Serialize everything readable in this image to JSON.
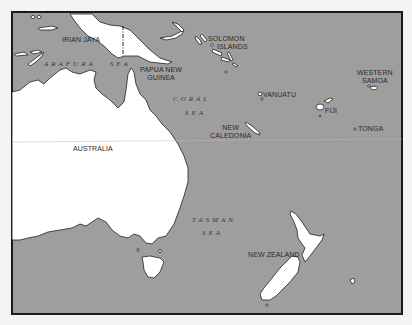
{
  "map": {
    "colors": {
      "sea": "#9e9e9e",
      "land": "#ffffff",
      "outline": "#222222",
      "frame": "#1a1a1a",
      "background": "#f4f4f2"
    },
    "countries": [
      {
        "id": "irian-jaya",
        "label": "IRIAN JAYA"
      },
      {
        "id": "papua-new-guinea",
        "label": "PAPUA NEW GUINEA"
      },
      {
        "id": "solomon-islands",
        "label": "SOLOMON ISLANDS"
      },
      {
        "id": "vanuatu",
        "label": "VANUATU"
      },
      {
        "id": "fiji",
        "label": "FIJI"
      },
      {
        "id": "western-samoa",
        "label": "WESTERN SAMOA"
      },
      {
        "id": "tonga",
        "label": "TONGA"
      },
      {
        "id": "new-caledonia",
        "label": "NEW CALEDONIA"
      },
      {
        "id": "australia",
        "label": "AUSTRALIA"
      },
      {
        "id": "new-zealand",
        "label": "NEW ZEALAND"
      }
    ],
    "labels": {
      "irian_jaya": "IRIAN JAYA",
      "png_1": "PAPUA NEW",
      "png_2": "GUINEA",
      "solomon_1": "SOLOMON",
      "solomon_2": "ISLANDS",
      "vanuatu": "VANUATU",
      "fiji": "FIJI",
      "samoa_1": "WESTERN",
      "samoa_2": "SAMOA",
      "tonga": "TONGA",
      "caledonia_1": "NEW",
      "caledonia_2": "CALEDONIA",
      "australia": "AUSTRALIA",
      "new_zealand": "NEW ZEALAND"
    },
    "seas": {
      "arafura": "ARAFURA   SEA",
      "coral_1": "CORAL",
      "coral_2": "SEA",
      "tasman_1": "TASMAN",
      "tasman_2": "SEA"
    }
  }
}
